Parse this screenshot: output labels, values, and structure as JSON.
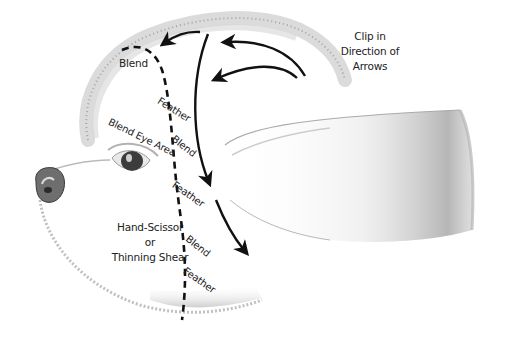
{
  "diagram": {
    "labels": {
      "clip_direction": [
        "Clip in",
        "Direction of",
        "Arrows"
      ],
      "blend_top": "Blend",
      "feather_1": "Feather",
      "blend_eye_area": "Blend Eye Area",
      "blend_2": "Blend",
      "feather_2": "Feather",
      "hand_scissor": [
        "Hand-Scissor",
        "or",
        "Thinning Shear"
      ],
      "blend_3": "Blend",
      "feather_3": "Feather"
    },
    "colors": {
      "ink": "#111111",
      "sketch": "#9a9a9a",
      "text": "#222222",
      "background": "#ffffff"
    }
  }
}
